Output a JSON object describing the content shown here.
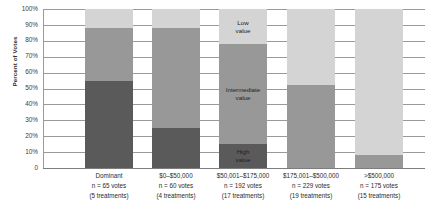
{
  "chart_data": {
    "type": "bar",
    "subtype": "stacked-100-percent",
    "title": "",
    "xlabel": "",
    "ylabel": "Percent of Votes",
    "ylim": [
      0,
      100
    ],
    "ytick_labels": [
      "100%",
      "90%",
      "80%",
      "70%",
      "60%",
      "50%",
      "40%",
      "30%",
      "20%",
      "10%",
      "0"
    ],
    "ytick_values": [
      100,
      90,
      80,
      70,
      60,
      50,
      40,
      30,
      20,
      10,
      0
    ],
    "grid": true,
    "legend": "none-inline-annotations",
    "categories": [
      "Dominant",
      "$0–$50,000",
      "$50,001–$175,000",
      "$175,001–$500,000",
      ">$500,000"
    ],
    "category_detail": [
      {
        "name": "Dominant",
        "votes_line": "n = 65 votes",
        "treatments_line": "(5 treatments)",
        "votes": 65,
        "treatments": 5
      },
      {
        "name": "$0–$50,000",
        "votes_line": "n = 60 votes",
        "treatments_line": "(4 treatments)",
        "votes": 60,
        "treatments": 4
      },
      {
        "name": "$50,001–$175,000",
        "votes_line": "n = 192 votes",
        "treatments_line": "(17 treatments)",
        "votes": 192,
        "treatments": 17
      },
      {
        "name": "$175,001–$500,000",
        "votes_line": "n = 229 votes",
        "treatments_line": "(19 treatments)",
        "votes": 229,
        "treatments": 19
      },
      {
        "name": ">$500,000",
        "votes_line": "n = 175 votes",
        "treatments_line": "(15 treatments)",
        "votes": 175,
        "treatments": 15
      }
    ],
    "series": [
      {
        "name": "High value",
        "color": "#5a5a5a",
        "values": [
          55,
          25,
          15,
          0,
          0
        ]
      },
      {
        "name": "Intermediate value",
        "color": "#989898",
        "values": [
          33,
          63,
          63,
          52,
          8
        ]
      },
      {
        "name": "Low value",
        "color": "#d4d4d4",
        "values": [
          12,
          12,
          22,
          48,
          92
        ]
      }
    ],
    "annotations": [
      {
        "text": "Low\nvalue",
        "category_index": 2,
        "series": "Low value"
      },
      {
        "text": "Intermediate\nvalue",
        "category_index": 2,
        "series": "Intermediate value"
      },
      {
        "text": "High\nvalue",
        "category_index": 2,
        "series": "High value"
      }
    ]
  }
}
